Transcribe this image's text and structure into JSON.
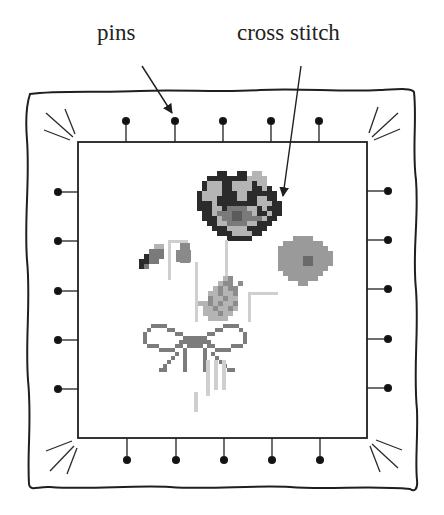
{
  "labels": {
    "pins": "pins",
    "cross_stitch": "cross stitch"
  },
  "diagram": {
    "type": "labeled illustration",
    "pins": {
      "top_x": [
        126,
        175,
        223,
        271,
        319
      ],
      "bottom_x": [
        126,
        175,
        223,
        271,
        319
      ],
      "left_y": [
        192,
        241,
        291,
        340,
        389
      ],
      "right_y": [
        191,
        240,
        289,
        339,
        388
      ]
    },
    "inner_frame": {
      "x": 78,
      "y": 142,
      "w": 289,
      "h": 296
    },
    "colors": {
      "ink": "#1f1f1f",
      "dark_stitch": "#2b2b2b",
      "mid_stitch": "#7a7a7a",
      "light_stitch": "#b4b4b4",
      "pale_stitch": "#cfcfcf"
    }
  }
}
